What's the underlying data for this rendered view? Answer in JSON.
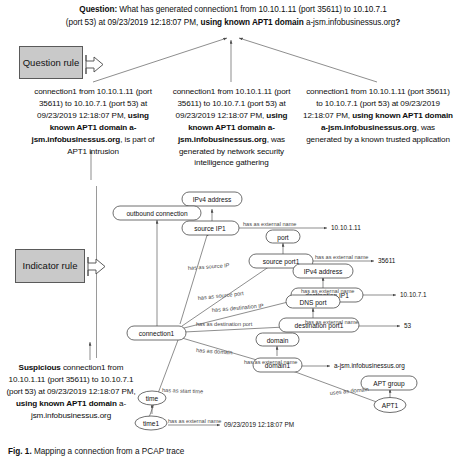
{
  "question": {
    "label": "Question:",
    "line1": "What has generated connection1 from 10.10.1.11  (port 35611) to 10.10.7.1",
    "line2_a": "(port 53) at 09/23/2019 12:18:07 PM, ",
    "line2_b": "using known APT1 domain ",
    "line2_c": "a-jsm.infobusinessus.org",
    "line2_d": "?"
  },
  "rules": {
    "question_rule": "Question rule",
    "indicator_rule": "Indicator rule"
  },
  "conclusions": [
    {
      "id": "conclusion-1",
      "pre": "connection1 from 10.10.1.11 (port 35611) to 10.10.7.1 (port 53) at 09/23/2019 12:18:07 PM, ",
      "bold": "using known APT1 domain a-jsm.infobusinessus.org",
      "post": ", is part of APT1 intrusion"
    },
    {
      "id": "conclusion-2",
      "pre": "connection1 from 10.10.1.11 (port 35611) to 10.10.7.1 (port 53) at 09/23/2019 12:18:07 PM, ",
      "bold": "using known APT1 domain a-jsm.infobusinessus.org",
      "post": ", was generated by network security intelligence gathering"
    },
    {
      "id": "conclusion-3",
      "pre": "connection1 from 10.10.1.11 (port 35611) to 10.10.7.1 (port 53) at 09/23/2019 12:18:07 PM, ",
      "bold": "using known APT1 domain a-jsm.infobusinessus.org",
      "post": ", was generated by a known trusted application"
    }
  ],
  "suspicious": {
    "bold1": "Suspicious",
    "mid": " connection1 from 10.10.1.11 (port 35611) to 10.10.7.1 (port 53) at 09/23/2019 12:18:07 PM, ",
    "bold2": "using known APT1 domain",
    "tail": " a-jsm.infobusinessus.org"
  },
  "graph": {
    "nodes": [
      {
        "id": "ipv4-address-1",
        "label": "IPv4 address"
      },
      {
        "id": "source-ip1",
        "label": "source IP1"
      },
      {
        "id": "port",
        "label": "port"
      },
      {
        "id": "source-port1",
        "label": "source port1"
      },
      {
        "id": "ipv4-address-2",
        "label": "IPv4 address"
      },
      {
        "id": "destination-ip1",
        "label": "destination IP1"
      },
      {
        "id": "dns-port",
        "label": "DNS port"
      },
      {
        "id": "destination-port1",
        "label": "destination port1"
      },
      {
        "id": "outbound-connection",
        "label": "outbound connection"
      },
      {
        "id": "connection1",
        "label": "connection1"
      },
      {
        "id": "domain",
        "label": "domain"
      },
      {
        "id": "domain1",
        "label": "domain1"
      },
      {
        "id": "time",
        "label": "time"
      },
      {
        "id": "time1",
        "label": "time1"
      },
      {
        "id": "apt-group",
        "label": "APT group"
      },
      {
        "id": "apt1",
        "label": "APT1"
      }
    ],
    "edge_labels": [
      {
        "id": "edge-has-as-source-ip",
        "text": "has as source IP"
      },
      {
        "id": "edge-has-as-source-port",
        "text": "has as source port"
      },
      {
        "id": "edge-has-as-destination-ip",
        "text": "has as destination IP"
      },
      {
        "id": "edge-has-as-destination-port",
        "text": "has as destination port"
      },
      {
        "id": "edge-has-as-domain",
        "text": "has as domain"
      },
      {
        "id": "edge-has-as-start-time",
        "text": "has as start time"
      },
      {
        "id": "edge-uses-as-domain",
        "text": "uses as domain"
      },
      {
        "id": "edge-ext-name-1",
        "text": "has as external name"
      },
      {
        "id": "edge-ext-name-2",
        "text": "has as external name"
      },
      {
        "id": "edge-ext-name-3",
        "text": "has as external name"
      },
      {
        "id": "edge-ext-name-4",
        "text": "has as external name"
      },
      {
        "id": "edge-ext-name-5",
        "text": "has as external name"
      },
      {
        "id": "edge-ext-name-6",
        "text": "has as external name"
      }
    ],
    "literals": [
      {
        "id": "literal-source-ip",
        "text": "10.10.1.11"
      },
      {
        "id": "literal-source-port",
        "text": "35611"
      },
      {
        "id": "literal-dest-ip",
        "text": "10.10.7.1"
      },
      {
        "id": "literal-dest-port",
        "text": "53"
      },
      {
        "id": "literal-domain",
        "text": "a-jsm.infobusinessus.org"
      },
      {
        "id": "literal-time",
        "text": "09/23/2019 12:18:07 PM"
      }
    ]
  },
  "caption": {
    "bold": "Fig. 1.",
    "text": " Mapping a connection from a PCAP trace"
  },
  "colors": {
    "rule_box_fill": "#c9c9c9",
    "rule_box_border": "#5a5a5a",
    "node_stroke": "#4a4a4a",
    "edge_stroke": "#5d5d5d",
    "edge_label": "#4a4a4a",
    "text": "#0d0d0d"
  }
}
